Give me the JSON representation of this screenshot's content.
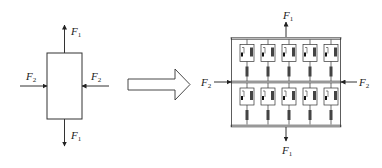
{
  "diagram": {
    "left": {
      "title": "single element under biaxial force",
      "forces": [
        {
          "id": "F1_top",
          "label": "F",
          "sub": "1",
          "direction": "up"
        },
        {
          "id": "F1_bottom",
          "label": "F",
          "sub": "1",
          "direction": "down"
        },
        {
          "id": "F2_left",
          "label": "F",
          "sub": "2",
          "direction": "right"
        },
        {
          "id": "F2_right",
          "label": "F",
          "sub": "2",
          "direction": "left"
        }
      ]
    },
    "transition_arrow": "hollow-right-arrow",
    "right": {
      "title": "parallel viscoelastic element model",
      "rows": 2,
      "columns": 5,
      "unit_components": [
        "dashpot",
        "spring",
        "series-spring"
      ],
      "forces": [
        {
          "id": "F1_top",
          "label": "F",
          "sub": "1",
          "direction": "up"
        },
        {
          "id": "F1_bottom",
          "label": "F",
          "sub": "1",
          "direction": "down"
        },
        {
          "id": "F2_left",
          "label": "F",
          "sub": "2",
          "direction": "right"
        },
        {
          "id": "F2_right",
          "label": "F",
          "sub": "2",
          "direction": "left"
        }
      ]
    },
    "colors": {
      "stroke": "#222222",
      "plate": "#bbbbbb",
      "spring_fill": "#444444"
    }
  }
}
